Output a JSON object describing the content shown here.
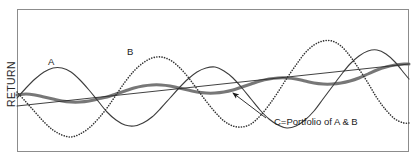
{
  "chart_data": {
    "type": "line",
    "title": "",
    "subtitle": "",
    "xlabel": "",
    "ylabel": "RETURN",
    "grid": false,
    "legend_position": "inline-annotations",
    "axis": {
      "x_ticks": [],
      "y_ticks": [],
      "x_range_note": "time (unlabeled)",
      "y_range_note": "return (unlabeled)"
    },
    "annotations": [
      {
        "id": "label-a",
        "text": "A",
        "x": 52,
        "y": 62,
        "describes": "Asset A — solid oscillating return series"
      },
      {
        "id": "label-b",
        "text": "B",
        "x": 131,
        "y": 52,
        "describes": "Asset B — dotted oscillating return series, out of phase with A"
      },
      {
        "id": "label-c",
        "text": "C=Portfolio of A & B",
        "x": 274,
        "y": 122,
        "describes": "Portfolio C — thick gray dampened series, leader line with arrowhead pointing to crossing point"
      }
    ],
    "series": [
      {
        "name": "A",
        "style": "solid",
        "color": "#3d3d3d",
        "width": 1.1,
        "description": "Sine wave with growing amplitude and upward drift",
        "x": [
          17,
          26,
          35,
          44,
          53,
          62,
          71,
          80,
          89,
          98,
          107,
          116,
          125,
          134,
          143,
          152,
          161,
          170,
          179,
          188,
          197,
          206,
          215,
          224,
          233,
          242,
          251,
          260,
          269,
          278,
          287,
          296,
          305,
          314,
          323,
          332,
          341,
          350,
          359,
          368,
          377,
          386,
          395,
          404,
          409
        ],
        "y": [
          98,
          88,
          79,
          72,
          68,
          68,
          72,
          80,
          90,
          101,
          112,
          120,
          125,
          126,
          123,
          117,
          108,
          98,
          88,
          79,
          72,
          68,
          67,
          71,
          78,
          88,
          99,
          110,
          119,
          125,
          128,
          126,
          120,
          111,
          99,
          87,
          75,
          64,
          56,
          51,
          50,
          54,
          62,
          73,
          79
        ]
      },
      {
        "name": "B",
        "style": "dotted",
        "color": "#333333",
        "width": 1.6,
        "description": "Sine wave roughly anti-phase to A, growing amplitude and upward drift",
        "x": [
          17,
          26,
          35,
          44,
          53,
          62,
          71,
          80,
          89,
          98,
          107,
          116,
          125,
          134,
          143,
          152,
          161,
          170,
          179,
          188,
          197,
          206,
          215,
          224,
          233,
          242,
          251,
          260,
          269,
          278,
          287,
          296,
          305,
          314,
          323,
          332,
          341,
          350,
          359,
          368,
          377,
          386,
          395,
          404,
          409
        ],
        "y": [
          92,
          102,
          112,
          122,
          130,
          135,
          137,
          134,
          128,
          119,
          108,
          95,
          82,
          71,
          63,
          58,
          57,
          60,
          67,
          77,
          89,
          101,
          112,
          121,
          126,
          127,
          124,
          116,
          105,
          92,
          78,
          65,
          53,
          45,
          41,
          41,
          46,
          56,
          69,
          83,
          98,
          110,
          119,
          123,
          123
        ]
      },
      {
        "name": "C",
        "style": "solid-thick",
        "color": "#777777",
        "width": 3.0,
        "description": "Portfolio of A and B — averaged series, much smaller amplitude, steady upward drift",
        "x": [
          17,
          26,
          35,
          44,
          53,
          62,
          71,
          80,
          89,
          98,
          107,
          116,
          125,
          134,
          143,
          152,
          161,
          170,
          179,
          188,
          197,
          206,
          215,
          224,
          233,
          242,
          251,
          260,
          269,
          278,
          287,
          296,
          305,
          314,
          323,
          332,
          341,
          350,
          359,
          368,
          377,
          386,
          395,
          404,
          409
        ],
        "y": [
          95,
          94,
          95,
          97,
          99,
          101,
          102,
          102,
          101,
          99,
          97,
          94,
          91,
          88,
          86,
          85,
          85,
          86,
          88,
          90,
          92,
          93,
          93,
          92,
          90,
          87,
          84,
          81,
          79,
          78,
          78,
          79,
          81,
          83,
          84,
          84,
          83,
          81,
          78,
          74,
          70,
          67,
          65,
          64,
          64
        ]
      },
      {
        "name": "trend",
        "style": "straight",
        "color": "#2b2b2b",
        "width": 0.9,
        "description": "Straight rising trend line across the plot",
        "x": [
          17,
          409
        ],
        "y": [
          106,
          64
        ]
      }
    ],
    "leader_line": {
      "from_x": 266,
      "from_y": 118,
      "to_x": 233,
      "to_y": 93,
      "arrowhead": "at-to-end"
    }
  },
  "figure": {
    "frame": {
      "left": 17,
      "top": 9,
      "right": 409,
      "bottom": 152,
      "border_color": "#8c8c8c"
    },
    "background": "#ffffff"
  }
}
